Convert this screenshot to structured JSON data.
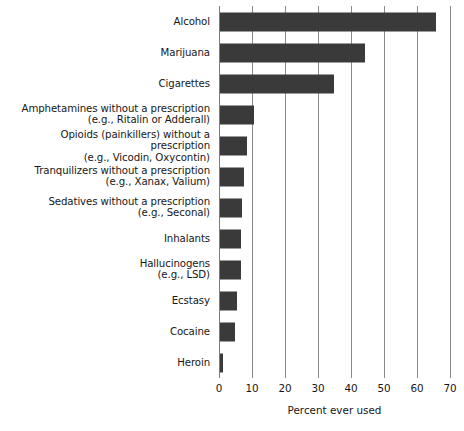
{
  "chart_data": {
    "type": "bar",
    "orientation": "horizontal",
    "title": "",
    "xlabel": "Percent ever used",
    "ylabel": "",
    "xlim": [
      0,
      70
    ],
    "xticks": [
      0,
      10,
      20,
      30,
      40,
      50,
      60,
      70
    ],
    "grid": true,
    "legend": null,
    "bar_color": "#3a3a3a",
    "gridline_color": "#8a8a8a",
    "categories": [
      "Alcohol",
      "Marijuana",
      "Cigarettes",
      "Amphetamines without a prescription\n(e.g., Ritalin or Adderall)",
      "Opioids (painkillers) without a prescription\n(e.g., Vicodin, Oxycontin)",
      "Tranquilizers without a prescription\n(e.g., Xanax, Valium)",
      "Sedatives without a prescription\n(e.g., Seconal)",
      "Inhalants",
      "Hallucinogens\n(e.g., LSD)",
      "Ecstasy",
      "Cocaine",
      "Heroin"
    ],
    "values": [
      65.5,
      44,
      34.5,
      10.3,
      8.2,
      7.3,
      6.7,
      6.5,
      6.3,
      5.2,
      4.5,
      1
    ]
  }
}
